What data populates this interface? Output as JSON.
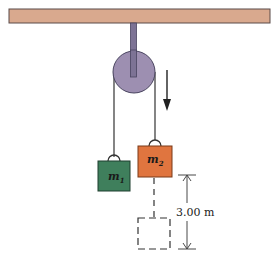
{
  "diagram": {
    "type": "atwood-machine",
    "ceiling": {
      "color": "#d9a98e",
      "border": "#5a4a48"
    },
    "pulley": {
      "color": "#9d8fb1",
      "rod_color": "#7d7395"
    },
    "motion_arrow": {
      "direction": "down",
      "color": "#222222"
    },
    "masses": [
      {
        "id": "m1",
        "label": "m",
        "subscript": "1",
        "color": "#3f7f5c"
      },
      {
        "id": "m2",
        "label": "m",
        "subscript": "2",
        "color": "#e0753f"
      }
    ],
    "dimension": {
      "label": "3.00 m",
      "value": 3.0,
      "unit": "m"
    },
    "final_position": {
      "style": "dashed",
      "mass": "m2"
    }
  }
}
